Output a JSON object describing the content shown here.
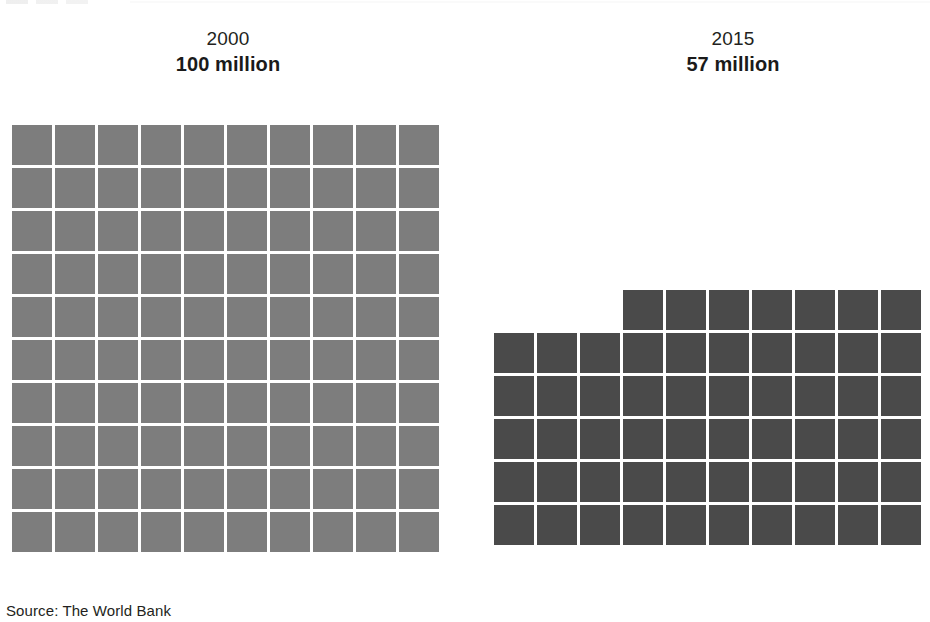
{
  "figure": {
    "source_note": "Source: The World Bank"
  },
  "panels": [
    {
      "id": "panel-2000",
      "year": "2000",
      "value_label": "100 million",
      "color": "#7d7d7d"
    },
    {
      "id": "panel-2015",
      "year": "2015",
      "value_label": "57 million",
      "color": "#4a4a4a"
    }
  ],
  "chart_data": {
    "type": "waffle",
    "title": "",
    "subtitle": "",
    "xlabel": "",
    "ylabel": "",
    "unit": "million",
    "square_value": 1,
    "grid_columns": 10,
    "legend_position": "none",
    "grid": false,
    "source": "The World Bank",
    "categories": [
      "2000",
      "2015"
    ],
    "values": [
      100,
      57
    ],
    "value_labels": [
      "100 million",
      "57 million"
    ],
    "series": [
      {
        "name": "2000",
        "value": 100,
        "value_label": "100 million",
        "squares": 100,
        "color": "#7d7d7d",
        "rows": [
          {
            "count": 10,
            "offset": 0
          },
          {
            "count": 10,
            "offset": 0
          },
          {
            "count": 10,
            "offset": 0
          },
          {
            "count": 10,
            "offset": 0
          },
          {
            "count": 10,
            "offset": 0
          },
          {
            "count": 10,
            "offset": 0
          },
          {
            "count": 10,
            "offset": 0
          },
          {
            "count": 10,
            "offset": 0
          },
          {
            "count": 10,
            "offset": 0
          },
          {
            "count": 10,
            "offset": 0
          }
        ]
      },
      {
        "name": "2015",
        "value": 57,
        "value_label": "57 million",
        "squares": 57,
        "color": "#4a4a4a",
        "rows": [
          {
            "count": 7,
            "offset": 3
          },
          {
            "count": 10,
            "offset": 0
          },
          {
            "count": 10,
            "offset": 0
          },
          {
            "count": 10,
            "offset": 0
          },
          {
            "count": 10,
            "offset": 0
          },
          {
            "count": 10,
            "offset": 0
          }
        ]
      }
    ]
  }
}
